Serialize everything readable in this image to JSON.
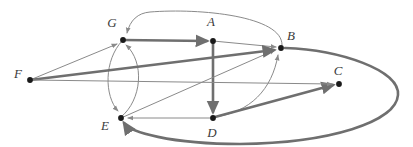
{
  "figure": {
    "name": "directed-graph-diagram",
    "width": 413,
    "height": 147,
    "background_color": "#ffffff",
    "edge_color_thin": "#8a8a8a",
    "edge_color_thick": "#6f6f6f",
    "vertex_color": "#1a1a1a",
    "label_color": "#3b3b3b"
  },
  "vertices": [
    {
      "id": "A",
      "label": "A",
      "x": 213,
      "y": 41,
      "label_x": 211,
      "label_y": 26
    },
    {
      "id": "B",
      "label": "B",
      "x": 281,
      "y": 48,
      "label_x": 291,
      "label_y": 40
    },
    {
      "id": "C",
      "label": "C",
      "x": 339,
      "y": 84,
      "label_x": 338,
      "label_y": 75
    },
    {
      "id": "D",
      "label": "D",
      "x": 213,
      "y": 118,
      "label_x": 212,
      "label_y": 137
    },
    {
      "id": "E",
      "label": "E",
      "x": 121,
      "y": 118,
      "label_x": 105,
      "label_y": 130
    },
    {
      "id": "F",
      "label": "F",
      "x": 30,
      "y": 80,
      "label_x": 18,
      "label_y": 78
    },
    {
      "id": "G",
      "label": "G",
      "x": 123,
      "y": 40,
      "label_x": 112,
      "label_y": 27
    }
  ],
  "edges": [
    {
      "id": "G-A",
      "from": "G",
      "to": "A",
      "directed": true,
      "weight": "thick",
      "shape": "straight",
      "path": "M 123 40 L 207 41"
    },
    {
      "id": "A-B",
      "from": "A",
      "to": "B",
      "directed": true,
      "weight": "thin",
      "shape": "straight",
      "path": "M 213 41 L 276 47"
    },
    {
      "id": "A-D",
      "from": "A",
      "to": "D",
      "directed": true,
      "weight": "thick",
      "shape": "straight",
      "path": "M 213 41 L 213 112"
    },
    {
      "id": "B-G",
      "from": "B",
      "to": "G",
      "directed": true,
      "weight": "thin",
      "shape": "curve-over-top",
      "path": "M 282 45 C 283 16 200 8 150 12 C 138 13 130 20 127 33"
    },
    {
      "id": "B-E",
      "from": "B",
      "to": "E",
      "directed": true,
      "weight": "thick",
      "shape": "large-outer-loop",
      "path": "M 285 48 C 340 50 400 70 398 95 C 396 122 330 143 240 144 C 170 144 130 132 124 123"
    },
    {
      "id": "D-B",
      "from": "D",
      "to": "B",
      "directed": true,
      "weight": "thin",
      "shape": "curve-right",
      "path": "M 215 117 C 250 112 272 90 278 55"
    },
    {
      "id": "D-C",
      "from": "D",
      "to": "C",
      "directed": true,
      "weight": "thick",
      "shape": "straight",
      "path": "M 215 117 L 333 85"
    },
    {
      "id": "D-E",
      "from": "D",
      "to": "E",
      "directed": true,
      "weight": "thin",
      "shape": "straight",
      "path": "M 213 118 L 128 118"
    },
    {
      "id": "E-B",
      "from": "E",
      "to": "B",
      "directed": true,
      "weight": "thin",
      "shape": "straight",
      "path": "M 121 118 L 275 50"
    },
    {
      "id": "E-G",
      "from": "E",
      "to": "G",
      "directed": true,
      "weight": "thin",
      "shape": "curve-bulge-right",
      "path": "M 121 117 C 142 100 145 62 126 45"
    },
    {
      "id": "G-E",
      "from": "G",
      "to": "E",
      "directed": true,
      "weight": "thin",
      "shape": "curve-bulge-left",
      "path": "M 122 41 C 104 60 104 96 118 111"
    },
    {
      "id": "F-G",
      "from": "F",
      "to": "G",
      "directed": true,
      "weight": "thin",
      "shape": "straight",
      "path": "M 30 80 L 117 44"
    },
    {
      "id": "F-B",
      "from": "F",
      "to": "B",
      "directed": true,
      "weight": "thick",
      "shape": "straight",
      "path": "M 30 80 L 274 50"
    },
    {
      "id": "F-C",
      "from": "F",
      "to": "C",
      "directed": true,
      "weight": "thin",
      "shape": "straight",
      "path": "M 30 80 L 332 84"
    }
  ]
}
